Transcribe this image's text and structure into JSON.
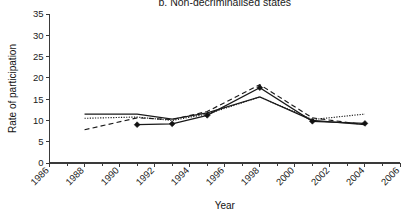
{
  "chart_data": {
    "type": "line",
    "title": "b. Non-decriminalised states",
    "xlabel": "Year",
    "ylabel": "Rate of participation",
    "xlim": [
      1986,
      2006
    ],
    "ylim": [
      0,
      35
    ],
    "xticks": [
      1986,
      1987,
      1988,
      1989,
      1990,
      1991,
      1992,
      1993,
      1994,
      1995,
      1996,
      1997,
      1998,
      1999,
      2000,
      2001,
      2002,
      2003,
      2004,
      2005,
      2006
    ],
    "xtick_labels": [
      "1986",
      "",
      "1988",
      "",
      "1990",
      "",
      "1992",
      "",
      "1994",
      "",
      "1996",
      "",
      "1998",
      "",
      "2000",
      "",
      "2002",
      "",
      "2004",
      "",
      "2006"
    ],
    "yticks": [
      0,
      5,
      10,
      15,
      20,
      25,
      30,
      35
    ],
    "ytick_labels": [
      "0",
      "5",
      "10",
      "15",
      "20",
      "25",
      "30",
      "35"
    ],
    "grid": false,
    "legend": "none",
    "xtick_label_rotation": -45,
    "series": [
      {
        "name": "observed",
        "style": "solid",
        "marker": "diamond",
        "x": [
          1991,
          1993,
          1995,
          1998,
          2001,
          2004
        ],
        "values": [
          9.0,
          9.2,
          11.2,
          17.7,
          9.8,
          9.3
        ]
      },
      {
        "name": "fitted-dotted",
        "style": "dotted",
        "marker": "none",
        "x": [
          1988,
          1991,
          1993,
          1995,
          1998,
          2001,
          2004
        ],
        "values": [
          10.5,
          10.8,
          10.0,
          11.5,
          15.5,
          10.2,
          11.5
        ]
      },
      {
        "name": "fitted-dashed",
        "style": "dashed",
        "marker": "none",
        "x": [
          1988,
          1991,
          1993,
          1995,
          1998,
          2001,
          2004
        ],
        "values": [
          7.8,
          10.6,
          10.2,
          12.1,
          18.4,
          10.6,
          9.0
        ]
      },
      {
        "name": "fitted-solid-upper",
        "style": "solid",
        "marker": "none",
        "x": [
          1988,
          1991,
          1993,
          1995,
          1998,
          2001,
          2004
        ],
        "values": [
          11.5,
          11.5,
          10.3,
          11.8,
          15.5,
          10.0,
          9.0
        ]
      }
    ],
    "colors": {
      "line": "#1a1a1a",
      "axis": "#3a3a3a",
      "background": "#ffffff"
    }
  }
}
